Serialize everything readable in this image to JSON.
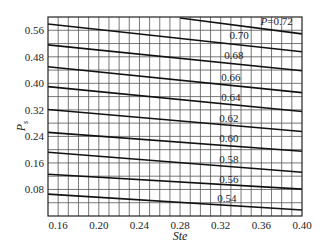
{
  "chart_data": {
    "type": "line",
    "title": "",
    "xlabel": "Ste",
    "ylabel": "P_s",
    "xlim": [
      0.15,
      0.4
    ],
    "ylim": [
      0.0,
      0.6
    ],
    "x_ticks": [
      0.16,
      0.2,
      0.24,
      0.28,
      0.32,
      0.36,
      0.4
    ],
    "x_tick_labels": [
      "0.16",
      "0.20",
      "0.24",
      "0.28",
      "0.32",
      "0.36",
      "0.40"
    ],
    "y_ticks": [
      0.08,
      0.16,
      0.24,
      0.32,
      0.4,
      0.48,
      0.56
    ],
    "y_tick_labels": [
      "0.08",
      "0.16",
      "0.24",
      "0.32",
      "0.40",
      "0.48",
      "0.56"
    ],
    "grid": true,
    "grid_x_step": 0.01,
    "grid_y_step": 0.04,
    "legend": "inline labels above each line",
    "series": [
      {
        "name": "P=0.72",
        "label": "P=0.72",
        "x": [
          0.28,
          0.4
        ],
        "y": [
          0.597,
          0.549
        ]
      },
      {
        "name": "0.70",
        "label": "0.70",
        "x": [
          0.15,
          0.4
        ],
        "y": [
          0.579,
          0.495
        ]
      },
      {
        "name": "0.68",
        "label": "0.68",
        "x": [
          0.15,
          0.4
        ],
        "y": [
          0.516,
          0.438
        ]
      },
      {
        "name": "0.66",
        "label": "0.66",
        "x": [
          0.15,
          0.4
        ],
        "y": [
          0.45,
          0.372
        ]
      },
      {
        "name": "0.64",
        "label": "0.64",
        "x": [
          0.15,
          0.4
        ],
        "y": [
          0.39,
          0.315
        ]
      },
      {
        "name": "0.62",
        "label": "0.62",
        "x": [
          0.15,
          0.4
        ],
        "y": [
          0.321,
          0.255
        ]
      },
      {
        "name": "0.60",
        "label": "0.60",
        "x": [
          0.15,
          0.4
        ],
        "y": [
          0.252,
          0.195
        ]
      },
      {
        "name": "0.58",
        "label": "0.58",
        "x": [
          0.15,
          0.4
        ],
        "y": [
          0.192,
          0.132
        ]
      },
      {
        "name": "0.56",
        "label": "0.56",
        "x": [
          0.15,
          0.4
        ],
        "y": [
          0.126,
          0.081
        ]
      },
      {
        "name": "0.54",
        "label": "0.54",
        "x": [
          0.15,
          0.4
        ],
        "y": [
          0.066,
          0.018
        ]
      }
    ],
    "label_positions": [
      {
        "text": "P=0.72",
        "x": 0.375,
        "y": 0.575
      },
      {
        "text": "0.70",
        "x": 0.338,
        "y": 0.533
      },
      {
        "text": "0.68",
        "x": 0.333,
        "y": 0.473
      },
      {
        "text": "0.66",
        "x": 0.33,
        "y": 0.408
      },
      {
        "text": "0.64",
        "x": 0.33,
        "y": 0.347
      },
      {
        "text": "0.62",
        "x": 0.328,
        "y": 0.283
      },
      {
        "text": "0.60",
        "x": 0.328,
        "y": 0.223
      },
      {
        "text": "0.58",
        "x": 0.328,
        "y": 0.16
      },
      {
        "text": "0.56",
        "x": 0.328,
        "y": 0.1
      },
      {
        "text": "0.54",
        "x": 0.326,
        "y": 0.043
      }
    ]
  }
}
